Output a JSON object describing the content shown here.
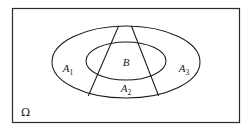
{
  "diagram": {
    "universe": {
      "symbol": "Ω",
      "name": "omega-universe-label"
    },
    "regions": [
      {
        "id": "A1",
        "label": "A",
        "subscript": "1",
        "name": "region-label-a1"
      },
      {
        "id": "B",
        "label": "B",
        "subscript": "",
        "name": "region-label-b"
      },
      {
        "id": "A3",
        "label": "A",
        "subscript": "3",
        "name": "region-label-a3"
      },
      {
        "id": "A2",
        "label": "A",
        "subscript": "2",
        "name": "region-label-a2"
      }
    ],
    "colors": {
      "stroke": "#1a1a1a",
      "frame": "#2b2b2b",
      "background": "#ffffff"
    }
  }
}
